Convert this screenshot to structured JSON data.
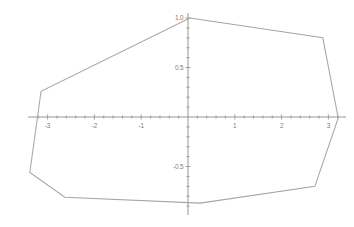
{
  "figure": {
    "title": "",
    "background_color": "#ffffff",
    "axis_color": "#8a8a8a",
    "curve_color": "#a6a6a6",
    "label_color": "#7d7d7d"
  },
  "chart_data": {
    "type": "line",
    "title": "",
    "xlabel": "",
    "ylabel": "",
    "xlim": [
      -3.45,
      3.55
    ],
    "ylim": [
      -1.1,
      1.12
    ],
    "grid": false,
    "legend": null,
    "axes": {
      "x_axis_y_value": 0,
      "y_axis_x_value": 0,
      "x_tick_labels": [
        "-3",
        "-2",
        "-1",
        "1",
        "2",
        "3"
      ],
      "x_tick_values": [
        -3,
        -2,
        -1,
        1,
        2,
        3
      ],
      "y_tick_labels": [
        "1.0",
        "0.5",
        "-0.5"
      ],
      "y_tick_values": [
        1.0,
        0.5,
        -0.5
      ],
      "x_minor_tick_step": 0.2,
      "y_minor_tick_step": 0.1
    },
    "series": [
      {
        "name": "convex-polygon",
        "closed": true,
        "x": [
          0.04,
          2.88,
          3.21,
          2.71,
          0.26,
          -2.63,
          -3.38,
          -3.14
        ],
        "y": [
          1.0,
          0.8,
          -0.01,
          -0.7,
          -0.87,
          -0.81,
          -0.56,
          0.26
        ]
      }
    ]
  }
}
